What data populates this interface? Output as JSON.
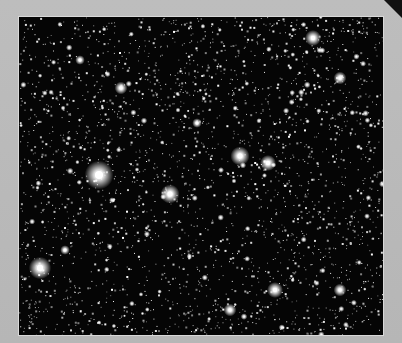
{
  "image": {
    "subject": "astronomical photograph of a dense star field",
    "mounting": "gray card border",
    "edge_text": "CLETED",
    "colors": {
      "card": "#b9b9b9",
      "sky": "#050505",
      "star": "#ffffff",
      "corner": "#111111"
    },
    "photo_frame": {
      "x": 19,
      "y": 17,
      "width": 364,
      "height": 318
    },
    "bright_stars": [
      {
        "x": 99,
        "y": 175,
        "r": 9
      },
      {
        "x": 170,
        "y": 194,
        "r": 6
      },
      {
        "x": 240,
        "y": 156,
        "r": 6
      },
      {
        "x": 268,
        "y": 163,
        "r": 5
      },
      {
        "x": 40,
        "y": 268,
        "r": 7
      },
      {
        "x": 313,
        "y": 38,
        "r": 5
      },
      {
        "x": 340,
        "y": 78,
        "r": 4
      },
      {
        "x": 121,
        "y": 88,
        "r": 4
      },
      {
        "x": 275,
        "y": 290,
        "r": 5
      },
      {
        "x": 230,
        "y": 310,
        "r": 4
      },
      {
        "x": 340,
        "y": 290,
        "r": 4
      },
      {
        "x": 65,
        "y": 250,
        "r": 3
      },
      {
        "x": 197,
        "y": 123,
        "r": 3
      },
      {
        "x": 80,
        "y": 60,
        "r": 3
      }
    ],
    "faint_star_count": 2600
  }
}
